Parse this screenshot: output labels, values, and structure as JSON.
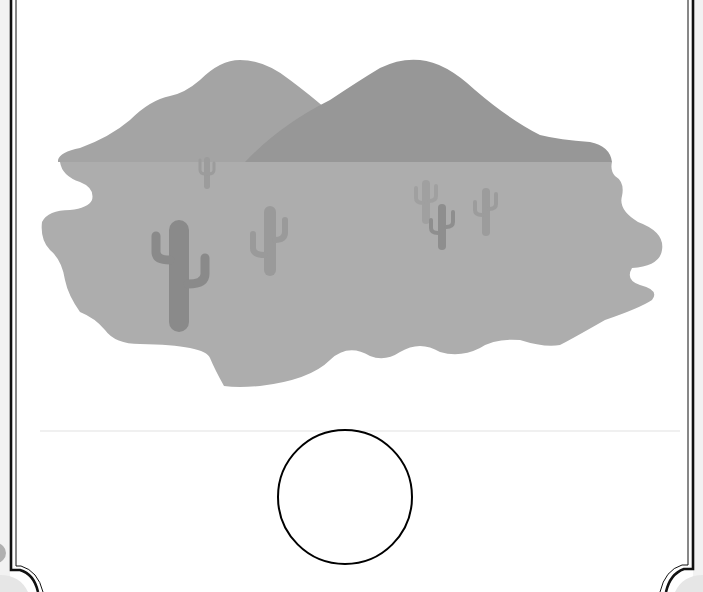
{
  "scene": {
    "title": "",
    "description": "desert landscape with mountains and cacti inside a decorative frame, empty circle below"
  },
  "colors": {
    "background": "#ffffff",
    "frame_stroke": "#111111",
    "left_mountain": "#a4a4a4",
    "right_mountain": "#979797",
    "ground": "#adadad",
    "cactus_dark": "#8a8a8a",
    "cactus_mid": "#969696",
    "cactus_light": "#a0a0a0",
    "circle_stroke": "#000000",
    "circle_fill": "#ffffff"
  },
  "elements": {
    "circle": {
      "cx": 345,
      "cy": 497,
      "r": 67
    }
  }
}
